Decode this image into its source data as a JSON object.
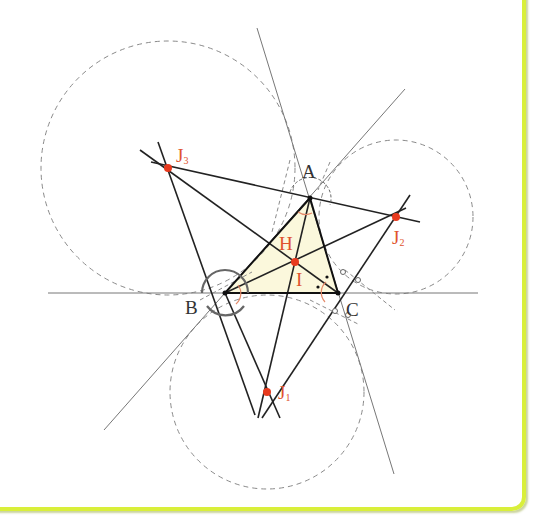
{
  "figure": {
    "colors": {
      "border": "#d9ef3a",
      "triangle_fill": "#fbf8dc",
      "point": "#e83a1e",
      "label_red": "#e0532e",
      "line": "#222222",
      "thin_line": "#777777",
      "dashed": "#8a8a8a"
    },
    "points": {
      "A": {
        "label": "A",
        "x": 310,
        "y": 198
      },
      "B": {
        "label": "B",
        "x": 225,
        "y": 293
      },
      "C": {
        "label": "C",
        "x": 338,
        "y": 293
      },
      "I": {
        "label": "I",
        "x": 295,
        "y": 262
      },
      "H": {
        "label": "H"
      },
      "J1": {
        "label": "J",
        "sub": "1",
        "x": 267,
        "y": 392,
        "r": 97
      },
      "J2": {
        "label": "J",
        "sub": "2",
        "x": 396,
        "y": 217,
        "r": 77
      },
      "J3": {
        "label": "J",
        "sub": "3",
        "x": 168,
        "y": 168,
        "r": 127
      }
    }
  }
}
